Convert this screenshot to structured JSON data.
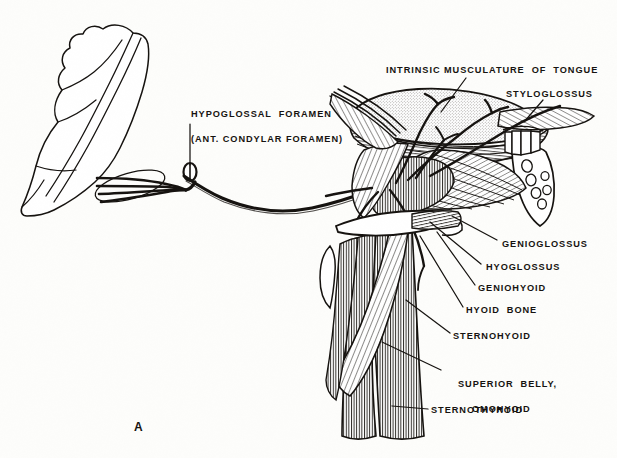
{
  "figure": {
    "letter": "A",
    "background_color": "#fdfdfb",
    "ink_color": "#15120f"
  },
  "labels": {
    "hypoglossal_foramen_line1": "HYPOGLOSSAL  FORAMEN",
    "hypoglossal_foramen_line2": "(ANT. CONDYLAR FORAMEN)",
    "intrinsic_musculature": "INTRINSIC MUSCULATURE  OF  TONGUE",
    "styloglossus": "STYLOGLOSSUS",
    "genioglossus": "GENIOGLOSSUS",
    "hyoglossus": "HYOGLOSSUS",
    "geniohyoid": "GENIOHYOID",
    "hyoid_bone": "HYOID  BONE",
    "sternohyoid": "STERNOHYOID",
    "superior_belly_line1": "SUPERIOR  BELLY,",
    "superior_belly_line2": "OMOHYOID",
    "sternothyroid": "STERNOTHYROID"
  },
  "structures": {
    "skull_fragment": "occipital-bone-fragment",
    "foramen": "hypoglossal-foramen-opening",
    "nerve": "hypoglossal-nerve-trunk",
    "tongue": "tongue-dorsum-stippled",
    "mandible": "cut-mandible-with-teeth",
    "strap_muscles": "infrahyoid-strap-muscles"
  }
}
